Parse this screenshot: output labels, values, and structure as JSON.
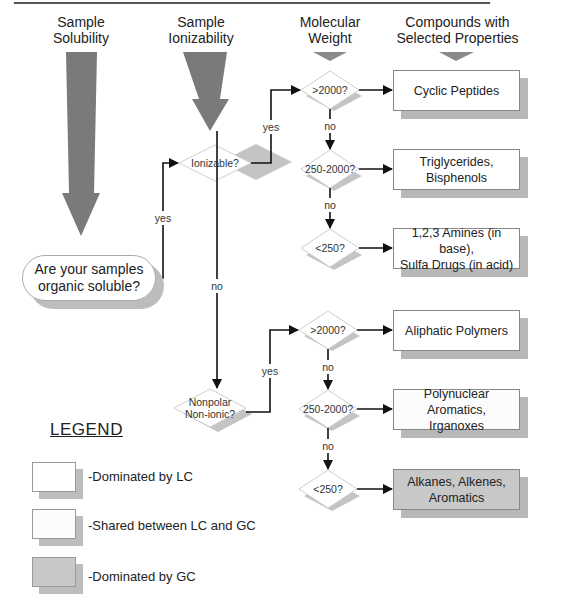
{
  "headers": {
    "solubility": "Sample\nSolubility",
    "ionizability": "Sample\nIonizability",
    "molecular_weight": "Molecular\nWeight",
    "compounds": "Compounds with\nSelected Properties"
  },
  "start_node": "Are your samples organic soluble?",
  "decisions": {
    "ionizable": "Ionizable?",
    "nonpolar": "Nonpolar\nNon-ionic?",
    "ion_gt2000": ">2000?",
    "ion_250_2000": "250-2000?",
    "ion_lt250": "<250?",
    "np_gt2000": ">2000?",
    "np_250_2000": "250-2000?",
    "np_lt250": "<250?"
  },
  "edges": {
    "soluble_yes": "yes",
    "ionizable_yes": "yes",
    "ionizable_no": "no",
    "nonpolar_yes": "yes",
    "ion_no_1": "no",
    "ion_no_2": "no",
    "np_no_1": "no",
    "np_no_2": "no"
  },
  "results": [
    {
      "label": "Cyclic Peptides",
      "category": "lc"
    },
    {
      "label": "Triglycerides,\nBisphenols",
      "category": "lc"
    },
    {
      "label": "1,2,3 Amines (in base),\nSulfa Drugs (in acid)",
      "category": "lc"
    },
    {
      "label": "Aliphatic Polymers",
      "category": "lc"
    },
    {
      "label": "Polynuclear Aromatics,\nIrganoxes",
      "category": "shared"
    },
    {
      "label": "Alkanes, Alkenes,\nAromatics",
      "category": "gc"
    }
  ],
  "legend": {
    "title": "LEGEND",
    "items": [
      {
        "label": "-Dominated by LC",
        "category": "lc"
      },
      {
        "label": "-Shared between LC and GC",
        "category": "shared"
      },
      {
        "label": "-Dominated by GC",
        "category": "gc"
      }
    ]
  },
  "colors": {
    "arrow_fill": "#7a7a7a",
    "shadow": "#b8b8b8",
    "gc_fill": "#c8c8c8",
    "line": "#111111"
  }
}
